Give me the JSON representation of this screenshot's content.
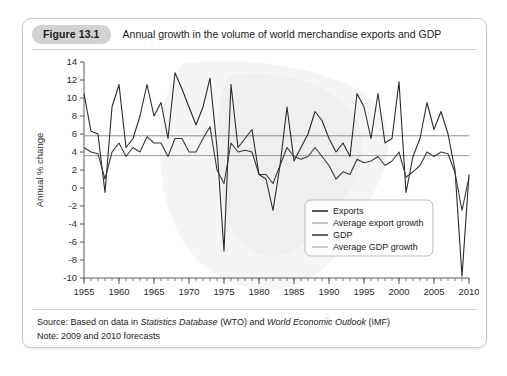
{
  "figure": {
    "number": "Figure 13.1",
    "title": "Annual growth in the volume of world merchandise exports and GDP",
    "source": "Source: Based on data in Statistics Database (WTO) and World Economic Outlook (IMF)",
    "source_prefix": "Source: Based on data in ",
    "source_italic_1": "Statistics Database",
    "source_mid": " (WTO) and ",
    "source_italic_2": "World Economic Outlook",
    "source_suffix": " (IMF)",
    "note": "Note: 2009 and 2010 forecasts"
  },
  "colors": {
    "exports_line": "#2b2b2b",
    "gdp_line": "#3a3a3a",
    "average_export_line": "#8c8c8c",
    "average_gdp_line": "#9a9a9a",
    "axis": "#5a5a5a",
    "tick_label": "#2b2b2b",
    "card_border": "#c9c9c9",
    "badge_bg": "#d2d2d2",
    "watermark": "#ededed"
  },
  "chart_data": {
    "type": "line",
    "title": "Annual growth in the volume of world merchandise exports and GDP",
    "xlabel": "",
    "ylabel": "Annual % change",
    "xlim": [
      1955,
      2010
    ],
    "ylim": [
      -10,
      14
    ],
    "ytick_step": 2,
    "yticks": [
      -10,
      -8,
      -6,
      -4,
      -2,
      0,
      2,
      4,
      6,
      8,
      10,
      12,
      14
    ],
    "xticks": [
      1955,
      1960,
      1965,
      1970,
      1975,
      1980,
      1985,
      1990,
      1995,
      2000,
      2005,
      2010
    ],
    "xtick_labels": [
      "1955",
      "1960",
      "1965",
      "1970",
      "1975",
      "1980",
      "1985",
      "1990",
      "1995",
      "2000",
      "2005",
      "2010"
    ],
    "ytick_labels": [
      "-10",
      "-8",
      "-6",
      "-4",
      "-2",
      "0",
      "2",
      "4",
      "6",
      "8",
      "10",
      "12",
      "14"
    ],
    "minor_xticks": true,
    "grid": false,
    "legend_position": "inside-lower-right",
    "x": [
      1955,
      1956,
      1957,
      1958,
      1959,
      1960,
      1961,
      1962,
      1963,
      1964,
      1965,
      1966,
      1967,
      1968,
      1969,
      1970,
      1971,
      1972,
      1973,
      1974,
      1975,
      1976,
      1977,
      1978,
      1979,
      1980,
      1981,
      1982,
      1983,
      1984,
      1985,
      1986,
      1987,
      1988,
      1989,
      1990,
      1991,
      1992,
      1993,
      1994,
      1995,
      1996,
      1997,
      1998,
      1999,
      2000,
      2001,
      2002,
      2003,
      2004,
      2005,
      2006,
      2007,
      2008,
      2009,
      2010
    ],
    "series": [
      {
        "name": "Exports",
        "color": "#2b2b2b",
        "values": [
          10.5,
          6.3,
          6.0,
          -0.5,
          9.0,
          11.5,
          4.5,
          5.5,
          8.0,
          11.5,
          8.0,
          9.5,
          5.5,
          12.8,
          11.0,
          9.0,
          7.0,
          9.0,
          12.2,
          4.5,
          -7.0,
          11.5,
          4.5,
          5.5,
          6.5,
          1.5,
          1.0,
          -2.5,
          2.5,
          9.0,
          3.0,
          4.5,
          6.0,
          8.5,
          7.5,
          5.5,
          4.0,
          5.0,
          3.5,
          10.5,
          9.0,
          5.5,
          10.5,
          5.0,
          5.5,
          11.8,
          -0.5,
          3.5,
          5.5,
          9.5,
          6.5,
          8.5,
          6.0,
          2.0,
          -9.8,
          1.5
        ]
      },
      {
        "name": "GDP",
        "color": "#3a3a3a",
        "values": [
          4.5,
          4.0,
          3.8,
          1.0,
          4.0,
          5.0,
          3.5,
          4.5,
          4.0,
          5.7,
          5.0,
          5.0,
          3.5,
          5.5,
          5.5,
          4.0,
          4.0,
          5.5,
          6.8,
          2.0,
          0.5,
          5.0,
          4.0,
          4.2,
          4.0,
          1.5,
          1.5,
          0.5,
          2.5,
          4.5,
          3.5,
          3.2,
          3.5,
          4.5,
          3.5,
          2.5,
          1.0,
          1.8,
          1.5,
          3.2,
          2.8,
          3.0,
          3.5,
          2.5,
          3.0,
          4.0,
          1.2,
          1.8,
          2.5,
          4.0,
          3.5,
          4.0,
          3.8,
          1.7,
          -2.5,
          1.2
        ]
      }
    ],
    "reference_lines": [
      {
        "name": "Average export growth",
        "value": 5.8,
        "color": "#8c8c8c"
      },
      {
        "name": "Average GDP growth",
        "value": 3.6,
        "color": "#9a9a9a"
      }
    ],
    "legend": [
      {
        "label": "Exports",
        "color": "#2b2b2b",
        "weight": "thick"
      },
      {
        "label": "Average export growth",
        "color": "#8c8c8c",
        "weight": "thin"
      },
      {
        "label": "GDP",
        "color": "#3a3a3a",
        "weight": "thick"
      },
      {
        "label": "Average GDP growth",
        "color": "#9a9a9a",
        "weight": "thin"
      }
    ]
  }
}
